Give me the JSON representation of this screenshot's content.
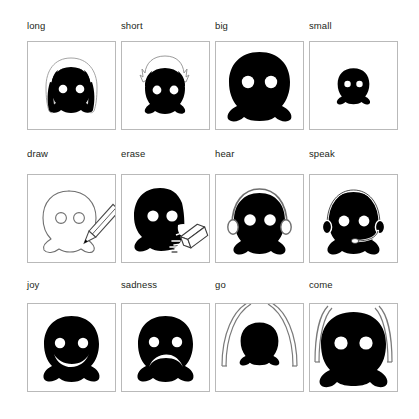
{
  "figure": {
    "title": "",
    "grid": {
      "columns": 4,
      "rows": 3
    },
    "colors": {
      "ink": "#000000",
      "frame": "#b9b9b9",
      "label": "#231f20",
      "paper": "#ffffff",
      "outline": "#8a8a8a"
    }
  },
  "cells": [
    {
      "label": "long",
      "icon": "blob-long-hair-icon",
      "concept": "long",
      "description": "dark blob face with long hair falling past the body, pale outline of hair silhouette",
      "eyes": 2,
      "mouth": "none"
    },
    {
      "label": "short",
      "icon": "blob-short-hair-icon",
      "concept": "short",
      "description": "dark blob face with short spiky hair outlined in white above the head",
      "eyes": 2,
      "mouth": "none"
    },
    {
      "label": "big",
      "icon": "blob-big-icon",
      "concept": "big",
      "description": "large solid black blob filling most of the frame with two white eyes",
      "eyes": 2,
      "mouth": "none"
    },
    {
      "label": "small",
      "icon": "blob-small-icon",
      "concept": "small",
      "description": "miniature solid black blob centered in the frame with two tiny white eyes",
      "eyes": 2,
      "mouth": "none"
    },
    {
      "label": "draw",
      "icon": "blob-outline-pencil-icon",
      "concept": "draw",
      "description": "blob drawn only as a thin outline while a pencil traces its lower right contour",
      "eyes": 2,
      "mouth": "none"
    },
    {
      "label": "erase",
      "icon": "blob-eraser-icon",
      "concept": "erase",
      "description": "solid black blob whose right side is being rubbed away by an eraser, leaving white smudges",
      "eyes": 2,
      "mouth": "none"
    },
    {
      "label": "hear",
      "icon": "blob-headphones-icon",
      "concept": "hear",
      "description": "black blob wearing outlined over-ear headphones, no microphone",
      "eyes": 2,
      "mouth": "none"
    },
    {
      "label": "speak",
      "icon": "blob-headset-microphone-icon",
      "concept": "speak",
      "description": "black blob wearing a headset with a boom microphone arm across the face",
      "eyes": 2,
      "mouth": "none"
    },
    {
      "label": "joy",
      "icon": "blob-smiling-icon",
      "concept": "joy",
      "description": "black blob with two white eyes and a wide upturned smile",
      "eyes": 2,
      "mouth": "smile"
    },
    {
      "label": "sadness",
      "icon": "blob-frowning-icon",
      "concept": "sadness",
      "description": "black blob with two white eyes and a downturned frowning mouth",
      "eyes": 2,
      "mouth": "frown"
    },
    {
      "label": "go",
      "icon": "blob-receding-icon",
      "concept": "go",
      "description": "small black blob without eyes shrinking away between two outward-sweeping motion arcs",
      "eyes": 0,
      "mouth": "none"
    },
    {
      "label": "come",
      "icon": "blob-approaching-icon",
      "concept": "come",
      "description": "large black blob with two white eyes advancing forward between two motion arcs",
      "eyes": 2,
      "mouth": "none"
    }
  ]
}
